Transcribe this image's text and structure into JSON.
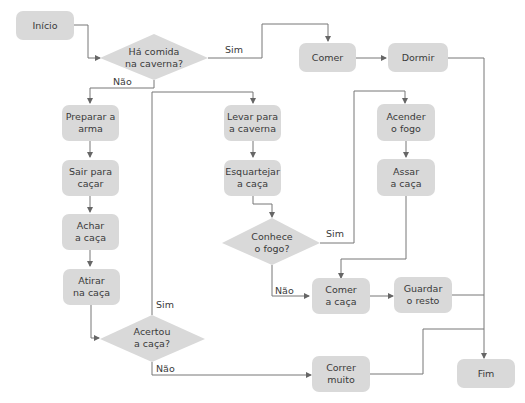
{
  "flowchart": {
    "colors": {
      "node_fill": "#d9d9d9",
      "line": "#666666",
      "text": "#3a3a3a"
    },
    "nodes": {
      "inicio": {
        "label": "Início",
        "shape": "rounded-rect"
      },
      "ha_comida": {
        "line1": "Há comida",
        "line2": "na caverna?",
        "shape": "diamond"
      },
      "comer": {
        "label": "Comer",
        "shape": "rounded-rect"
      },
      "dormir": {
        "label": "Dormir",
        "shape": "rounded-rect"
      },
      "preparar_arma": {
        "line1": "Preparar a",
        "line2": "arma",
        "shape": "rounded-rect"
      },
      "sair_cacar": {
        "line1": "Sair para",
        "line2": "caçar",
        "shape": "rounded-rect"
      },
      "achar_caca": {
        "line1": "Achar",
        "line2": "a caça",
        "shape": "rounded-rect"
      },
      "atirar_caca": {
        "line1": "Atirar",
        "line2": "na caça",
        "shape": "rounded-rect"
      },
      "acertou": {
        "line1": "Acertou",
        "line2": "a caça?",
        "shape": "diamond"
      },
      "levar_caverna": {
        "line1": "Levar para",
        "line2": "a caverna",
        "shape": "rounded-rect"
      },
      "esquartejar": {
        "line1": "Esquartejar",
        "line2": "a caça",
        "shape": "rounded-rect"
      },
      "conhece_fogo": {
        "line1": "Conhece",
        "line2": "o fogo?",
        "shape": "diamond"
      },
      "acender_fogo": {
        "line1": "Acender",
        "line2": "o fogo",
        "shape": "rounded-rect"
      },
      "assar_caca": {
        "line1": "Assar",
        "line2": "a caça",
        "shape": "rounded-rect"
      },
      "comer_caca": {
        "line1": "Comer",
        "line2": "a caça",
        "shape": "rounded-rect"
      },
      "guardar_resto": {
        "line1": "Guardar",
        "line2": "o resto",
        "shape": "rounded-rect"
      },
      "correr_muito": {
        "line1": "Correr",
        "line2": "muito",
        "shape": "rounded-rect"
      },
      "fim": {
        "label": "Fim",
        "shape": "rounded-rect"
      }
    },
    "edge_labels": {
      "ha_comida_sim": "Sim",
      "ha_comida_nao": "Não",
      "conhece_fogo_sim": "Sim",
      "conhece_fogo_nao": "Não",
      "acertou_sim": "Sim",
      "acertou_nao": "Não"
    },
    "edges": [
      {
        "from": "Início",
        "to": "Há comida na caverna?"
      },
      {
        "from": "Há comida na caverna?",
        "to": "Comer",
        "label": "Sim"
      },
      {
        "from": "Há comida na caverna?",
        "to": "Preparar a arma",
        "label": "Não"
      },
      {
        "from": "Comer",
        "to": "Dormir"
      },
      {
        "from": "Dormir",
        "to": "Fim"
      },
      {
        "from": "Preparar a arma",
        "to": "Sair para caçar"
      },
      {
        "from": "Sair para caçar",
        "to": "Achar a caça"
      },
      {
        "from": "Achar a caça",
        "to": "Atirar na caça"
      },
      {
        "from": "Atirar na caça",
        "to": "Acertou a caça?"
      },
      {
        "from": "Acertou a caça?",
        "to": "Levar para a caverna",
        "label": "Sim"
      },
      {
        "from": "Acertou a caça?",
        "to": "Correr muito",
        "label": "Não"
      },
      {
        "from": "Levar para a caverna",
        "to": "Esquartejar a caça"
      },
      {
        "from": "Esquartejar a caça",
        "to": "Conhece o fogo?"
      },
      {
        "from": "Conhece o fogo?",
        "to": "Acender o fogo",
        "label": "Sim"
      },
      {
        "from": "Conhece o fogo?",
        "to": "Comer a caça",
        "label": "Não"
      },
      {
        "from": "Acender o fogo",
        "to": "Assar a caça"
      },
      {
        "from": "Assar a caça",
        "to": "Comer a caça"
      },
      {
        "from": "Comer a caça",
        "to": "Guardar o resto"
      },
      {
        "from": "Guardar o resto",
        "to": "Fim"
      },
      {
        "from": "Correr muito",
        "to": "Fim"
      }
    ]
  }
}
